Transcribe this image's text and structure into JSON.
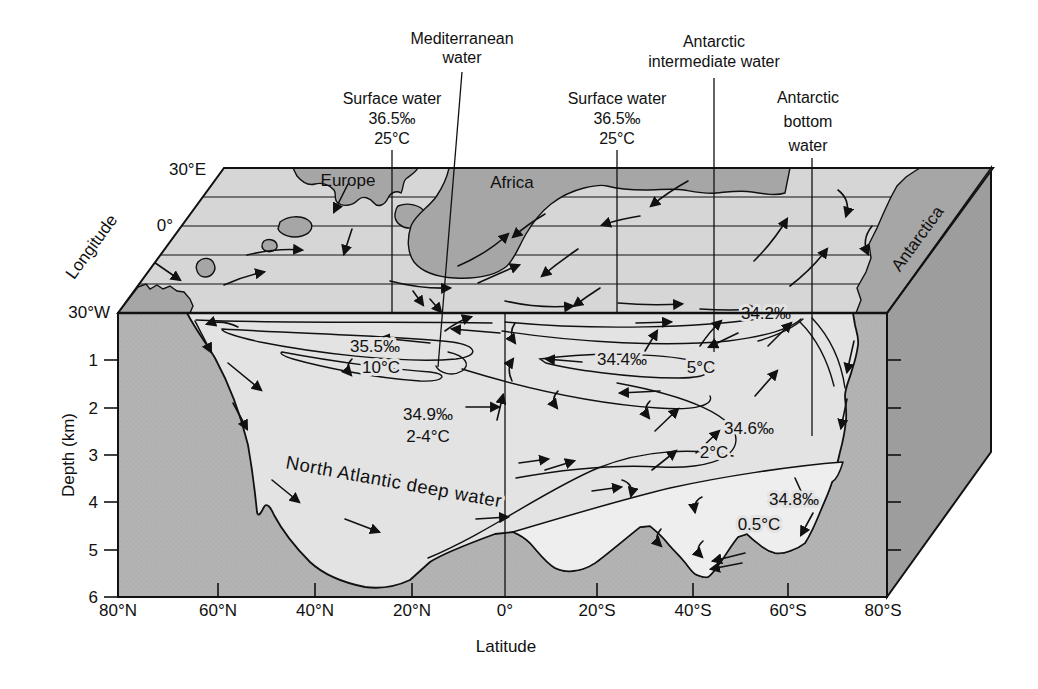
{
  "figure": {
    "axes": {
      "depth": {
        "title": "Depth (km)",
        "ticks": [
          "1",
          "2",
          "3",
          "4",
          "5",
          "6"
        ]
      },
      "latitude": {
        "title": "Latitude",
        "ticks": [
          "80°N",
          "60°N",
          "40°N",
          "20°N",
          "0°",
          "20°S",
          "40°S",
          "60°S",
          "80°S"
        ]
      },
      "longitude": {
        "title": "Longitude",
        "ticks": [
          "30°E",
          "0°",
          "30°W"
        ]
      }
    },
    "continents": {
      "europe": "Europe",
      "africa": "Africa",
      "antarctica": "Antarctica"
    },
    "callouts": {
      "mediterranean": {
        "line1": "Mediterranean",
        "line2": "water"
      },
      "surface_left": {
        "line1": "Surface water",
        "line2": "36.5‰",
        "line3": "25°C"
      },
      "surface_right": {
        "line1": "Surface water",
        "line2": "36.5‰",
        "line3": "25°C"
      },
      "antarctic_intermediate": {
        "line1": "Antarctic",
        "line2": "intermediate water"
      },
      "antarctic_bottom": {
        "line1": "Antarctic",
        "line2": "bottom",
        "line3": "water"
      }
    },
    "water_masses": {
      "north_atlantic_deep": {
        "name": "North Atlantic deep water"
      },
      "central": {
        "salinity": "35.5‰",
        "temp": "10°C"
      },
      "nadw": {
        "salinity": "34.9‰",
        "temp": "2-4°C"
      },
      "aaiw": {
        "salinity": "34.4‰",
        "temp": "5°C"
      },
      "south_surface": {
        "salinity": "34.2‰"
      },
      "circumpolar": {
        "salinity": "34.6‰",
        "temp": "2°C"
      },
      "aabw": {
        "salinity": "34.8‰",
        "temp": "0.5°C"
      }
    },
    "colors": {
      "background": "#ffffff",
      "ocean_top": "#d6d6d6",
      "land": "#a6a6a6",
      "section_water": "#e3e3e3",
      "section_earth": "#b3b3b3",
      "side_face": "#9e9e9e",
      "bottom_water": "#eeeeee",
      "line": "#111111"
    }
  }
}
